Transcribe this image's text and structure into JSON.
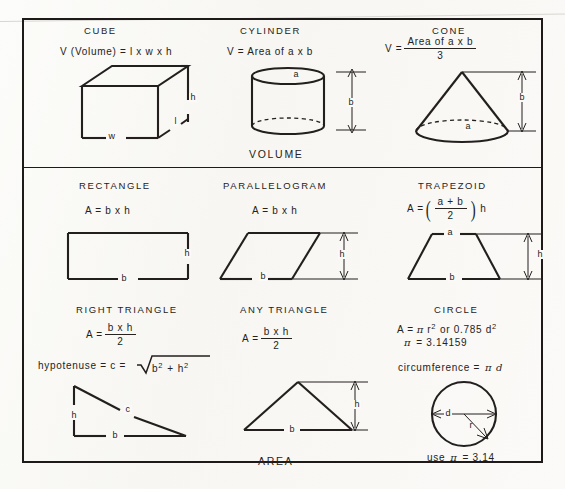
{
  "document": {
    "title": "Volume and Area Formulas Reference Chart",
    "sections": [
      {
        "name": "volume",
        "label": "VOLUME"
      },
      {
        "name": "area",
        "label": "AREA"
      }
    ]
  },
  "volume": {
    "section_label": "VOLUME",
    "cells": [
      {
        "heading": "CUBE",
        "formula": "V (Volume)  =  l  x  w  x  h",
        "shape": "cube",
        "labels": [
          "h",
          "l",
          "w"
        ]
      },
      {
        "heading": "CYLINDER",
        "formula": "V  =  Area of a  x  b",
        "shape": "cylinder",
        "labels": [
          "a",
          "b"
        ]
      },
      {
        "heading": "CONE",
        "formula_lhs": "V  =",
        "formula_numerator": "Area of a  x  b",
        "formula_denominator": "3",
        "shape": "cone",
        "labels": [
          "a",
          "b"
        ]
      }
    ]
  },
  "area": {
    "section_label": "AREA",
    "cells": [
      {
        "heading": "RECTANGLE",
        "formula": "A  =  b  x  h",
        "shape": "rectangle",
        "labels": [
          "b",
          "h"
        ]
      },
      {
        "heading": "PARALLELOGRAM",
        "formula": "A  =  b  x  h",
        "shape": "parallelogram",
        "labels": [
          "b",
          "h"
        ]
      },
      {
        "heading": "TRAPEZOID",
        "formula_lhs": "A  =",
        "formula_numerator": "a  +  b",
        "formula_denominator": "2",
        "formula_tail": "h",
        "shape": "trapezoid",
        "labels": [
          "a",
          "b",
          "h"
        ]
      },
      {
        "heading": "RIGHT TRIANGLE",
        "formula_lhs": "A  =",
        "formula_numerator": "b  x  h",
        "formula_denominator": "2",
        "hypotenuse_formula": "hypotenuse  =  c  =",
        "hypotenuse_radicand_a": "b",
        "hypotenuse_radicand_exp_a": "2",
        "hypotenuse_radicand_plus": "+",
        "hypotenuse_radicand_b": "h",
        "hypotenuse_radicand_exp_b": "2",
        "shape": "right-triangle",
        "labels": [
          "h",
          "c",
          "b"
        ]
      },
      {
        "heading": "ANY TRIANGLE",
        "formula_lhs": "A  =",
        "formula_numerator": "b  x  h",
        "formula_denominator": "2",
        "shape": "any-triangle",
        "labels": [
          "b",
          "h"
        ]
      },
      {
        "heading": "CIRCLE",
        "area_formula_prefix": "A  =",
        "area_formula_pi": "π",
        "area_formula_r": "r",
        "area_formula_r_exp": "2",
        "area_formula_mid": "or  0.785  d",
        "area_formula_d_exp": "2",
        "pi_symbol": "π",
        "pi_equals": "=  3.14159",
        "circumference_label": "circumference  =",
        "circumference_value": "π d",
        "use_pi_prefix": "use",
        "use_pi_symbol": "π",
        "use_pi_value": "=  3.14",
        "shape": "circle",
        "labels": [
          "d",
          "r"
        ]
      }
    ]
  },
  "colors": {
    "ink": "#231f1e",
    "paper": "#fbfaf7",
    "frame": "#1d1a19"
  }
}
